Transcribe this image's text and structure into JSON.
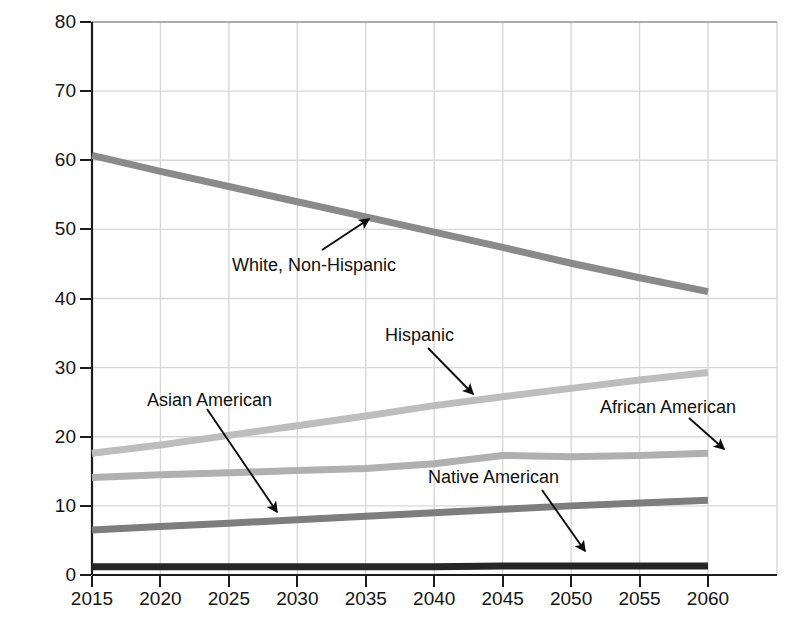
{
  "chart_data": {
    "type": "line",
    "title": "",
    "xlabel": "",
    "ylabel": "Percentage of the U.S. population",
    "xlim": [
      2015,
      2060
    ],
    "ylim": [
      0,
      80
    ],
    "grid": true,
    "legend_position": "inline-annotations",
    "x": [
      2015,
      2020,
      2025,
      2030,
      2035,
      2040,
      2045,
      2050,
      2055,
      2060
    ],
    "xticklabels": [
      "2015",
      "2020",
      "2025",
      "2030",
      "2035",
      "2040",
      "2045",
      "2050",
      "2055",
      "2060"
    ],
    "yticklabels": [
      "0",
      "10",
      "20",
      "30",
      "40",
      "50",
      "60",
      "70",
      "80"
    ],
    "yticks": [
      0,
      10,
      20,
      30,
      40,
      50,
      60,
      70,
      80
    ],
    "series": [
      {
        "name": "White, Non-Hispanic",
        "color": "#8a8a8a",
        "values": [
          60.7,
          58.4,
          56.2,
          54.0,
          51.8,
          49.6,
          47.4,
          45.1,
          43.0,
          41.0
        ]
      },
      {
        "name": "Hispanic",
        "color": "#bdbdbd",
        "values": [
          17.6,
          18.8,
          20.2,
          21.6,
          23.0,
          24.5,
          25.8,
          27.0,
          28.2,
          29.3
        ]
      },
      {
        "name": "African American",
        "color": "#b0b0b0",
        "values": [
          14.1,
          14.5,
          14.8,
          15.1,
          15.4,
          16.1,
          17.3,
          17.1,
          17.3,
          17.6
        ]
      },
      {
        "name": "Asian American",
        "color": "#7d7d7d",
        "values": [
          6.5,
          7.0,
          7.5,
          8.0,
          8.5,
          9.0,
          9.5,
          10.0,
          10.4,
          10.8
        ]
      },
      {
        "name": "Native American",
        "color": "#262626",
        "values": [
          1.2,
          1.2,
          1.2,
          1.2,
          1.2,
          1.2,
          1.3,
          1.3,
          1.3,
          1.3
        ]
      }
    ],
    "annotations": [
      {
        "label": "White, Non-Hispanic",
        "text_x": 232,
        "text_y": 255,
        "arrow_from_x": 322,
        "arrow_from_y": 250,
        "arrow_to_x": 369,
        "arrow_to_y": 219
      },
      {
        "label": "Hispanic",
        "text_x": 385,
        "text_y": 325,
        "arrow_from_x": 428,
        "arrow_from_y": 348,
        "arrow_to_x": 473,
        "arrow_to_y": 394
      },
      {
        "label": "Asian American",
        "text_x": 147,
        "text_y": 390,
        "arrow_from_x": 207,
        "arrow_from_y": 409,
        "arrow_to_x": 277,
        "arrow_to_y": 512
      },
      {
        "label": "African American",
        "text_x": 600,
        "text_y": 397,
        "arrow_from_x": 689,
        "arrow_from_y": 418,
        "arrow_to_x": 724,
        "arrow_to_y": 449
      },
      {
        "label": "Native American",
        "text_x": 428,
        "text_y": 467,
        "arrow_from_x": 542,
        "arrow_from_y": 490,
        "arrow_to_x": 585,
        "arrow_to_y": 551
      }
    ]
  }
}
